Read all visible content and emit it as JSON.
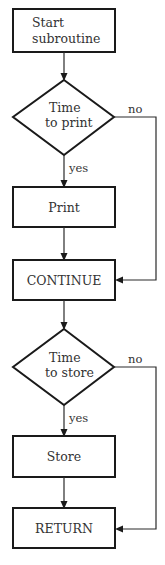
{
  "diagram": {
    "type": "flowchart",
    "nodes": {
      "start": {
        "shape": "rectangle",
        "lines": [
          "Start",
          "subroutine"
        ]
      },
      "decision_print": {
        "shape": "diamond",
        "lines": [
          "Time",
          "to print"
        ]
      },
      "print": {
        "shape": "rectangle",
        "label": "Print"
      },
      "continue": {
        "shape": "rectangle",
        "label": "CONTINUE"
      },
      "decision_store": {
        "shape": "diamond",
        "lines": [
          "Time",
          "to store"
        ]
      },
      "store": {
        "shape": "rectangle",
        "label": "Store"
      },
      "return": {
        "shape": "rectangle",
        "label": "RETURN"
      }
    },
    "edges": {
      "print_yes": "yes",
      "print_no": "no",
      "store_yes": "yes",
      "store_no": "no"
    },
    "connections": [
      {
        "from": "start",
        "to": "decision_print"
      },
      {
        "from": "decision_print",
        "to": "print",
        "label": "yes"
      },
      {
        "from": "decision_print",
        "to": "continue",
        "label": "no"
      },
      {
        "from": "print",
        "to": "continue"
      },
      {
        "from": "continue",
        "to": "decision_store"
      },
      {
        "from": "decision_store",
        "to": "store",
        "label": "yes"
      },
      {
        "from": "decision_store",
        "to": "return",
        "label": "no"
      },
      {
        "from": "store",
        "to": "return"
      }
    ],
    "colors": {
      "stroke": "#1a1a1a",
      "text": "#333333",
      "background": "#ffffff"
    }
  }
}
